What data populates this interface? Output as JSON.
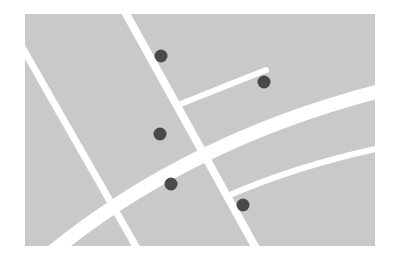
{
  "map": {
    "background_color": "#ffffff",
    "area": {
      "x": 25,
      "y": 14,
      "width": 350,
      "height": 232,
      "fill": "#c9c9c9"
    },
    "road_color": "#ffffff",
    "roads": [
      {
        "name": "road-left-diagonal",
        "d": "M 18 40 L 138 250",
        "width": 7
      },
      {
        "name": "road-middle-diagonal",
        "d": "M 124 10 L 257 250",
        "width": 8
      },
      {
        "name": "road-main-curve",
        "d": "M 52 252 Q 190 140 380 91",
        "width": 14
      },
      {
        "name": "road-branch-upper",
        "d": "M 178 105 L 266 70",
        "width": 6
      },
      {
        "name": "road-branch-lower",
        "d": "M 232 194 Q 300 165 380 148",
        "width": 6
      }
    ],
    "marker_color": "#4a4a4a",
    "markers": [
      {
        "name": "marker-1",
        "cx": 161,
        "cy": 56,
        "r": 6.5
      },
      {
        "name": "marker-2",
        "cx": 264,
        "cy": 82,
        "r": 6.5
      },
      {
        "name": "marker-3",
        "cx": 160,
        "cy": 134,
        "r": 6.5
      },
      {
        "name": "marker-4",
        "cx": 171,
        "cy": 184,
        "r": 6.5
      },
      {
        "name": "marker-5",
        "cx": 243,
        "cy": 205,
        "r": 6.5
      }
    ]
  }
}
